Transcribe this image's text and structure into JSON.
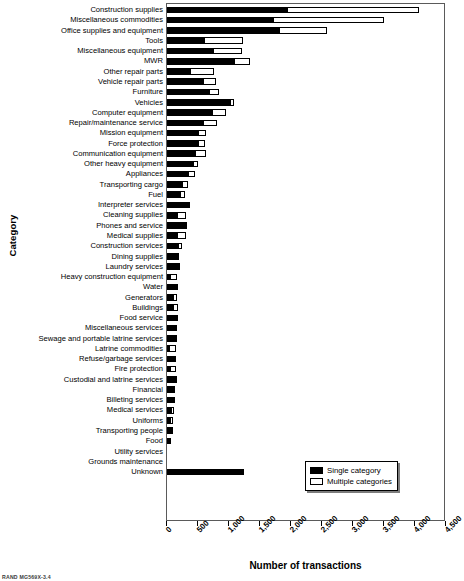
{
  "footer": {
    "note": "RAND MG569X-3.4"
  },
  "legend": {
    "position": "bottom-right",
    "items": [
      {
        "label": "Single category",
        "swatch": "black-filled-square-icon",
        "color": "#000000"
      },
      {
        "label": "Multiple categories",
        "swatch": "white-outlined-square-icon",
        "color": "#ffffff"
      }
    ]
  },
  "chart_data": {
    "type": "bar",
    "orientation": "horizontal",
    "stacked": true,
    "title": "",
    "xlabel": "Number of transactions",
    "ylabel": "Category",
    "xlim": [
      0,
      4500
    ],
    "xticks": [
      0,
      500,
      1000,
      1500,
      2000,
      2500,
      3000,
      3500,
      4000,
      4500
    ],
    "xtick_labels": [
      "0",
      "500",
      "1,000",
      "1,500",
      "2,000",
      "2,500",
      "3,000",
      "3,500",
      "4,000",
      "4,500"
    ],
    "grid": false,
    "categories": [
      "Construction supplies",
      "Miscellaneous commodities",
      "Office supplies and equipment",
      "Tools",
      "Miscellaneous equipment",
      "MWR",
      "Other repair parts",
      "Vehicle repair parts",
      "Furniture",
      "Vehicles",
      "Computer equipment",
      "Repair/maintenance service",
      "Mission equipment",
      "Force protection",
      "Communication equipment",
      "Other heavy equipment",
      "Appliances",
      "Transporting cargo",
      "Fuel",
      "Interpreter services",
      "Cleaning supplies",
      "Phones and service",
      "Medical supplies",
      "Construction services",
      "Dining supplies",
      "Laundry services",
      "Heavy construction equipment",
      "Water",
      "Generators",
      "Buildings",
      "Food service",
      "Miscellaneous services",
      "Sewage and portable latrine services",
      "Latrine commodities",
      "Refuse/garbage services",
      "Fire protection",
      "Custodial and latrine services",
      "Financial",
      "Billeting services",
      "Medical services",
      "Uniforms",
      "Transporting people",
      "Food",
      "Utility services",
      "Grounds maintenance",
      "Unknown"
    ],
    "series": [
      {
        "name": "Single category",
        "color": "#000000",
        "values": [
          1950,
          1720,
          1830,
          620,
          760,
          1100,
          380,
          600,
          700,
          1040,
          740,
          600,
          520,
          520,
          470,
          430,
          350,
          250,
          230,
          390,
          180,
          310,
          180,
          190,
          170,
          230,
          70,
          200,
          120,
          110,
          200,
          150,
          180,
          50,
          130,
          70,
          150,
          145,
          145,
          75,
          70,
          105,
          80,
          15,
          10,
          1250
        ]
      },
      {
        "name": "Multiple categories",
        "color": "#ffffff",
        "values": [
          2130,
          1800,
          770,
          630,
          470,
          250,
          400,
          200,
          150,
          60,
          220,
          230,
          130,
          110,
          180,
          80,
          110,
          100,
          75,
          0,
          140,
          30,
          150,
          75,
          40,
          0,
          100,
          0,
          55,
          80,
          0,
          25,
          0,
          115,
          20,
          85,
          10,
          0,
          0,
          60,
          45,
          0,
          0,
          0,
          0,
          0
        ]
      }
    ]
  }
}
